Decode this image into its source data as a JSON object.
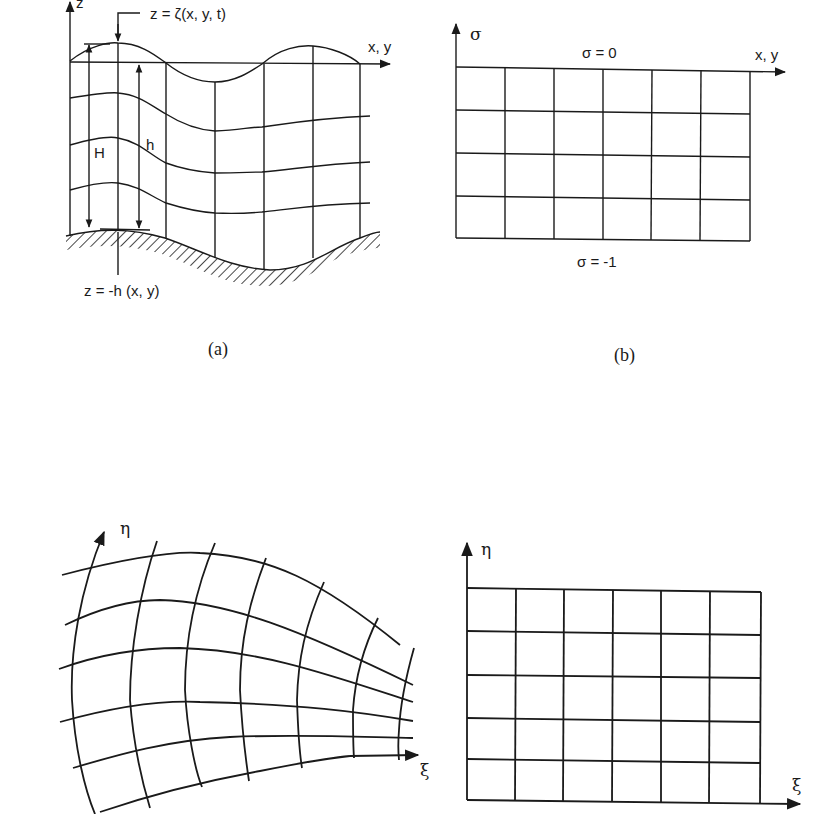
{
  "figure": {
    "panels": [
      {
        "id": "a",
        "caption": "(a)",
        "title": "Physical domain vertical section with free surface and bottom",
        "axis_z_label": "z",
        "axis_x_label": "x, y",
        "surface_label": "z = ζ(x, y, t)",
        "bottom_label": "z = -h (x, y)",
        "depth_total_label": "H",
        "depth_still_label": "h",
        "vertical_levels": 5,
        "columns": 8
      },
      {
        "id": "b",
        "caption": "(b)",
        "title": "Sigma-coordinate transformed domain",
        "axis_sigma_label": "σ",
        "axis_x_label": "x, y",
        "top_label": "σ = 0",
        "bottom_label": "σ = -1",
        "rows": 4,
        "cols": 6
      },
      {
        "id": "c",
        "title": "Curvilinear horizontal grid in physical space",
        "axis_eta_label": "η",
        "axis_xi_label": "ξ",
        "rows": 6,
        "cols": 7
      },
      {
        "id": "d",
        "title": "Rectangular computational grid",
        "axis_eta_label": "η",
        "axis_xi_label": "ξ",
        "rows": 5,
        "cols": 6
      }
    ]
  }
}
